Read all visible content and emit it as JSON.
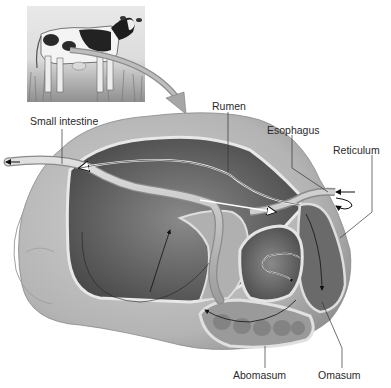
{
  "figure": {
    "inset": "cow-photo",
    "labels": {
      "small_intestine": "Small intestine",
      "rumen": "Rumen",
      "esophagus": "Esophagus",
      "reticulum": "Reticulum",
      "abomasum": "Abomasum",
      "omasum": "Omasum"
    }
  },
  "colors": {
    "background": "#ffffff",
    "stomach_outer": "#b8b8b8",
    "stomach_interior": "#5a5a5a",
    "stomach_wall": "#d4d4d4",
    "label_text": "#2a2a2a",
    "pointer_arrow": "#9a9a9a"
  }
}
